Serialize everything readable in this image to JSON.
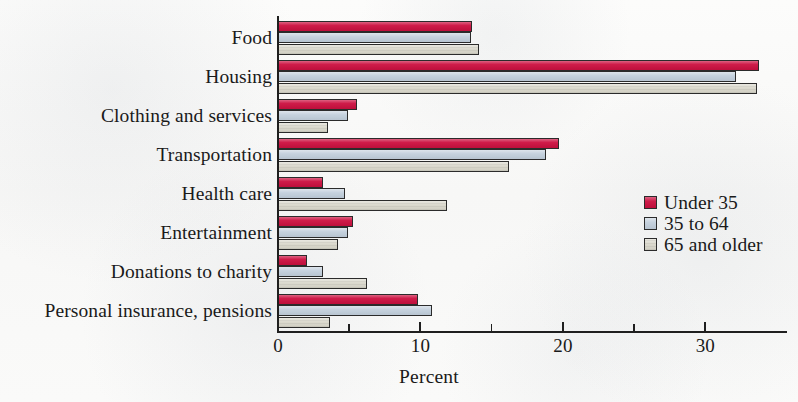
{
  "chart_data": {
    "type": "bar",
    "orientation": "horizontal",
    "title": "",
    "xlabel": "Percent",
    "ylabel": "",
    "xlim": [
      0,
      35.8
    ],
    "xticks": [
      0,
      10,
      20,
      30
    ],
    "xtick_labels": [
      "0",
      "10",
      "20",
      "30"
    ],
    "xminor_ticks": [
      5,
      15,
      25
    ],
    "grid": false,
    "legend_position": "center right",
    "categories": [
      "Food",
      "Housing",
      "Clothing and services",
      "Transportation",
      "Health care",
      "Entertainment",
      "Donations to charity",
      "Personal insurance, pensions"
    ],
    "series": [
      {
        "name": "Under 35",
        "color": "#cc1040",
        "values": [
          13.7,
          33.8,
          5.6,
          19.8,
          3.2,
          5.3,
          2.1,
          9.9
        ]
      },
      {
        "name": "35 to 64",
        "color": "#c2cfdc",
        "values": [
          13.6,
          32.2,
          5.0,
          18.9,
          4.8,
          5.0,
          3.2,
          10.9
        ]
      },
      {
        "name": "65 and older",
        "color": "#d9d7cb",
        "values": [
          14.2,
          33.7,
          3.6,
          16.3,
          11.9,
          4.3,
          6.3,
          3.7
        ]
      }
    ]
  },
  "axis": {
    "x_title": "Percent"
  },
  "legend": {
    "items": [
      {
        "label": "Under 35",
        "color": "#cc1040"
      },
      {
        "label": "35 to 64",
        "color": "#c2cfdc"
      },
      {
        "label": "65 and older",
        "color": "#d9d7cb"
      }
    ]
  },
  "colors": {
    "under_35": "#cc1040",
    "age_35_to_64": "#c2cfdc",
    "age_65_and_older": "#d9d7cb",
    "axis": "#1f1f1f",
    "background": "#fbfbfa"
  }
}
